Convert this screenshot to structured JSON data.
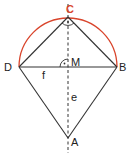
{
  "diagram": {
    "type": "kite-with-thales-semicircle",
    "colors": {
      "lines": "#333333",
      "arc": "#d9442b",
      "label": "#222222",
      "label_highlight": "#d9442b"
    },
    "points": {
      "C": {
        "label": "C",
        "x": 68,
        "y": 17
      },
      "D": {
        "label": "D",
        "x": 19,
        "y": 67
      },
      "B": {
        "label": "B",
        "x": 117,
        "y": 67
      },
      "M": {
        "label": "M",
        "x": 68,
        "y": 67
      },
      "A": {
        "label": "A",
        "x": 68,
        "y": 138
      }
    },
    "segments": {
      "f": {
        "label": "f"
      },
      "e": {
        "label": "e"
      }
    }
  }
}
